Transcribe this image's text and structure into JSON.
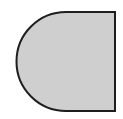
{
  "figure": {
    "colors": {
      "background": "#ffffff",
      "fill": "#cfcfcf",
      "stroke": "#1e1e1e"
    },
    "geometry": {
      "top": 12,
      "bottom": 111,
      "left_extreme": 17,
      "right": 115,
      "arc_center_x": 66,
      "radius": 49.5,
      "stroke_width": 2
    }
  }
}
